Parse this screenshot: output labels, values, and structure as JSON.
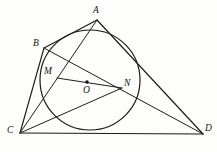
{
  "figure": {
    "background_color": "#fdfdfb",
    "stroke_color": "#1a1a1a",
    "labels": {
      "a": "A",
      "b": "B",
      "c": "C",
      "d": "D",
      "m": "M",
      "n": "N",
      "o": "O"
    },
    "points": {
      "A": {
        "x": 97,
        "y": 20
      },
      "B": {
        "x": 44,
        "y": 48
      },
      "C": {
        "x": 20,
        "y": 133
      },
      "D": {
        "x": 203,
        "y": 134
      },
      "M": {
        "x": 57,
        "y": 78
      },
      "N": {
        "x": 122,
        "y": 88
      },
      "O": {
        "x": 87,
        "y": 82
      }
    },
    "label_positions": {
      "A": {
        "x": 93,
        "y": 6
      },
      "B": {
        "x": 33,
        "y": 39
      },
      "C": {
        "x": 7,
        "y": 126
      },
      "D": {
        "x": 205,
        "y": 124
      },
      "M": {
        "x": 44,
        "y": 67
      },
      "N": {
        "x": 124,
        "y": 79
      },
      "O": {
        "x": 83,
        "y": 86
      }
    },
    "circle": {
      "cx": 90,
      "cy": 80,
      "r": 50
    },
    "segments": [
      {
        "name": "side-AB",
        "from": "A",
        "to": "B"
      },
      {
        "name": "side-BC",
        "from": "B",
        "to": "C"
      },
      {
        "name": "side-CD",
        "from": "C",
        "to": "D"
      },
      {
        "name": "side-DA",
        "from": "D",
        "to": "A"
      },
      {
        "name": "diagonal-AC",
        "from": "A",
        "to": "C"
      },
      {
        "name": "diagonal-BD",
        "from": "B",
        "to": "D"
      },
      {
        "name": "chord-MN",
        "from": "M",
        "to": "N"
      },
      {
        "name": "segment-CN",
        "from": "C",
        "to": "N"
      }
    ]
  }
}
